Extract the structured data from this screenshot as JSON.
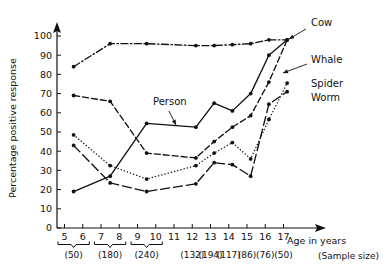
{
  "chart_data": {
    "type": "line",
    "title": "",
    "xlabel": "Age in years",
    "ylabel": "Percentage positive response",
    "xlim": [
      4.4,
      18.6
    ],
    "ylim": [
      0,
      108
    ],
    "grid": false,
    "legend_position": "inline-right",
    "yticks": [
      0,
      10,
      20,
      30,
      40,
      50,
      60,
      70,
      80,
      90,
      100
    ],
    "xticks": [
      5,
      6,
      7,
      8,
      9,
      10,
      11,
      12,
      13,
      14,
      15,
      16,
      17
    ],
    "xtick_labels": [
      "5",
      "6",
      "7",
      "8",
      "9",
      "10",
      "11",
      "12",
      "13",
      "14",
      "15",
      "16",
      "17"
    ],
    "sample_size_caption": "(Sample size)",
    "sample_sizes": [
      {
        "label": "(50)",
        "ages": [
          5,
          6
        ],
        "bracket": true
      },
      {
        "label": "(180)",
        "ages": [
          7,
          8
        ],
        "bracket": true
      },
      {
        "label": "(240)",
        "ages": [
          9,
          10
        ],
        "bracket": true
      },
      {
        "label": "(132)",
        "ages": [
          12
        ],
        "bracket": false
      },
      {
        "label": "(194)",
        "ages": [
          13
        ],
        "bracket": false
      },
      {
        "label": "(117)",
        "ages": [
          14
        ],
        "bracket": false
      },
      {
        "label": "(86)",
        "ages": [
          15
        ],
        "bracket": false
      },
      {
        "label": "(76)",
        "ages": [
          16
        ],
        "bracket": false
      },
      {
        "label": "(50)",
        "ages": [
          17
        ],
        "bracket": false
      }
    ],
    "series": [
      {
        "name": "Cow",
        "style": "dashdot",
        "dasharray": "7,2.5,1.5,2.5",
        "x": [
          5.5,
          7.5,
          9.5,
          12.2,
          13.2,
          14.2,
          15.2,
          16.2,
          17.2
        ],
        "values": [
          84,
          96,
          96,
          95,
          95,
          95.5,
          96,
          98,
          98
        ]
      },
      {
        "name": "Whale",
        "style": "dashed",
        "dasharray": "6,3",
        "x": [
          5.5,
          7.5,
          9.5,
          12.2,
          13.2,
          14.2,
          15.2,
          16.2,
          17.2
        ],
        "values": [
          69,
          66,
          39,
          36.5,
          45,
          52.5,
          58.5,
          76,
          98
        ]
      },
      {
        "name": "Spider",
        "style": "dotted",
        "dasharray": "0.2,3.1",
        "x": [
          5.5,
          7.5,
          9.5,
          12.2,
          13.2,
          14.2,
          15.2,
          16.2,
          17.2
        ],
        "values": [
          48.5,
          32.5,
          25.5,
          32.5,
          39,
          44.5,
          36,
          56.5,
          75.5
        ]
      },
      {
        "name": "Person",
        "style": "solid",
        "dasharray": "none",
        "x": [
          5.5,
          7.5,
          9.5,
          12.2,
          13.2,
          14.2,
          15.2,
          16.2,
          17.2
        ],
        "values": [
          19,
          27,
          54.5,
          52.5,
          65,
          61,
          70,
          90,
          98
        ]
      },
      {
        "name": "Worm",
        "style": "longdash",
        "dasharray": "9,4",
        "x": [
          5.5,
          7.5,
          9.5,
          12.2,
          13.2,
          14.2,
          15.2,
          16.2,
          17.2
        ],
        "values": [
          43,
          23.5,
          19,
          23,
          34,
          33,
          27,
          64.5,
          71
        ]
      }
    ],
    "annotations": [
      {
        "text": "Cow",
        "x": 311,
        "y": 26,
        "leader": [
          [
            306,
            29
          ],
          [
            289,
            39
          ]
        ]
      },
      {
        "text": "Whale",
        "x": 311,
        "y": 63,
        "leader": [
          [
            307,
            64
          ],
          [
            283,
            73
          ]
        ]
      },
      {
        "text": "Spider",
        "x": 311,
        "y": 87,
        "leader": []
      },
      {
        "text": "Worm",
        "x": 311,
        "y": 101,
        "leader": []
      },
      {
        "text": "Person",
        "x": 153,
        "y": 105,
        "leader": [
          [
            169,
            111
          ],
          [
            176,
            125
          ]
        ]
      }
    ]
  }
}
